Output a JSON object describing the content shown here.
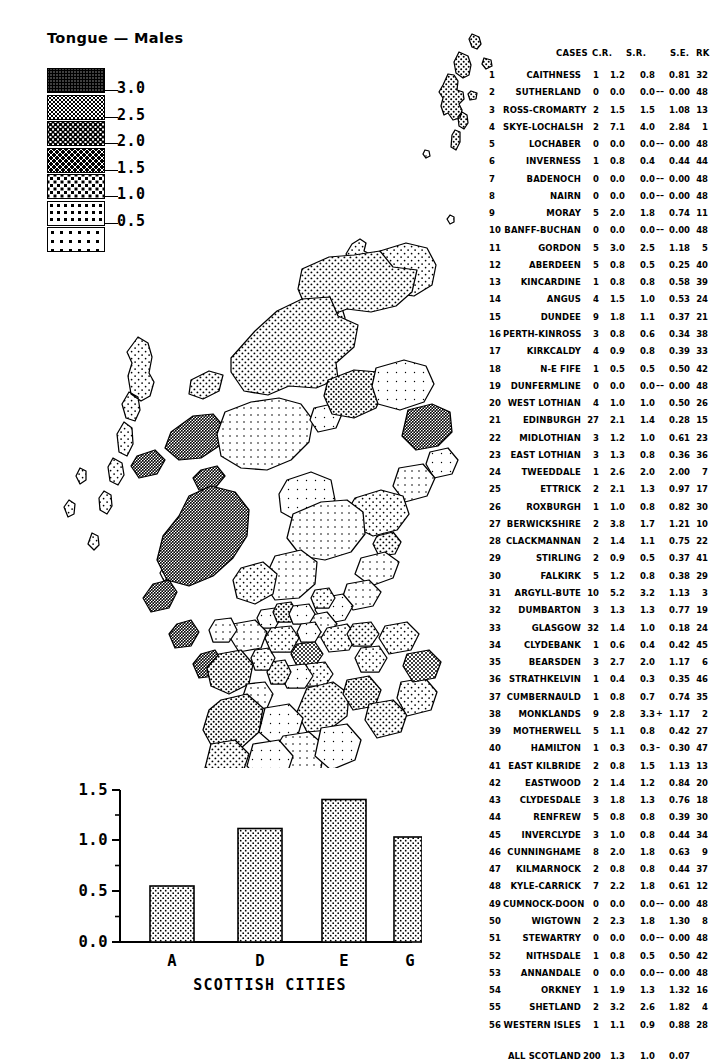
{
  "title": "Tongue — Males",
  "legend": {
    "name": "shading-legend",
    "labels": [
      "3.0",
      "2.5",
      "2.0",
      "1.5",
      "1.0",
      "0.5"
    ],
    "swatch_count": 7
  },
  "table": {
    "headers": {
      "cases": "CASES",
      "cr": "C.R.",
      "sr": "S.R.",
      "se": "S.E.",
      "rk": "RK"
    },
    "rows": [
      {
        "n": "1",
        "name": "CAITHNESS",
        "cases": "1",
        "cr": "1.2",
        "sr": "0.8",
        "sig": "",
        "se": "0.81",
        "rk": "32"
      },
      {
        "n": "2",
        "name": "SUTHERLAND",
        "cases": "0",
        "cr": "0.0",
        "sr": "0.0",
        "sig": "––",
        "se": "0.00",
        "rk": "48"
      },
      {
        "n": "3",
        "name": "ROSS-CROMARTY",
        "cases": "2",
        "cr": "1.5",
        "sr": "1.5",
        "sig": "",
        "se": "1.08",
        "rk": "13"
      },
      {
        "n": "4",
        "name": "SKYE-LOCHALSH",
        "cases": "2",
        "cr": "7.1",
        "sr": "4.0",
        "sig": "",
        "se": "2.84",
        "rk": "1"
      },
      {
        "n": "5",
        "name": "LOCHABER",
        "cases": "0",
        "cr": "0.0",
        "sr": "0.0",
        "sig": "––",
        "se": "0.00",
        "rk": "48"
      },
      {
        "n": "6",
        "name": "INVERNESS",
        "cases": "1",
        "cr": "0.8",
        "sr": "0.4",
        "sig": "",
        "se": "0.44",
        "rk": "44"
      },
      {
        "n": "7",
        "name": "BADENOCH",
        "cases": "0",
        "cr": "0.0",
        "sr": "0.0",
        "sig": "––",
        "se": "0.00",
        "rk": "48"
      },
      {
        "n": "8",
        "name": "NAIRN",
        "cases": "0",
        "cr": "0.0",
        "sr": "0.0",
        "sig": "––",
        "se": "0.00",
        "rk": "48"
      },
      {
        "n": "9",
        "name": "MORAY",
        "cases": "5",
        "cr": "2.0",
        "sr": "1.8",
        "sig": "",
        "se": "0.74",
        "rk": "11"
      },
      {
        "n": "10",
        "name": "BANFF-BUCHAN",
        "cases": "0",
        "cr": "0.0",
        "sr": "0.0",
        "sig": "––",
        "se": "0.00",
        "rk": "48"
      },
      {
        "n": "11",
        "name": "GORDON",
        "cases": "5",
        "cr": "3.0",
        "sr": "2.5",
        "sig": "",
        "se": "1.18",
        "rk": "5"
      },
      {
        "n": "12",
        "name": "ABERDEEN",
        "cases": "5",
        "cr": "0.8",
        "sr": "0.5",
        "sig": "",
        "se": "0.25",
        "rk": "40"
      },
      {
        "n": "13",
        "name": "KINCARDINE",
        "cases": "1",
        "cr": "0.8",
        "sr": "0.8",
        "sig": "",
        "se": "0.58",
        "rk": "39"
      },
      {
        "n": "14",
        "name": "ANGUS",
        "cases": "4",
        "cr": "1.5",
        "sr": "1.0",
        "sig": "",
        "se": "0.53",
        "rk": "24"
      },
      {
        "n": "15",
        "name": "DUNDEE",
        "cases": "9",
        "cr": "1.8",
        "sr": "1.1",
        "sig": "",
        "se": "0.37",
        "rk": "21"
      },
      {
        "n": "16",
        "name": "PERTH-KINROSS",
        "cases": "3",
        "cr": "0.8",
        "sr": "0.6",
        "sig": "",
        "se": "0.34",
        "rk": "38"
      },
      {
        "n": "17",
        "name": "KIRKCALDY",
        "cases": "4",
        "cr": "0.9",
        "sr": "0.8",
        "sig": "",
        "se": "0.39",
        "rk": "33"
      },
      {
        "n": "18",
        "name": "N-E FIFE",
        "cases": "1",
        "cr": "0.5",
        "sr": "0.5",
        "sig": "",
        "se": "0.50",
        "rk": "42"
      },
      {
        "n": "19",
        "name": "DUNFERMLINE",
        "cases": "0",
        "cr": "0.0",
        "sr": "0.0",
        "sig": "––",
        "se": "0.00",
        "rk": "48"
      },
      {
        "n": "20",
        "name": "WEST LOTHIAN",
        "cases": "4",
        "cr": "1.0",
        "sr": "1.0",
        "sig": "",
        "se": "0.50",
        "rk": "26"
      },
      {
        "n": "21",
        "name": "EDINBURGH",
        "cases": "27",
        "cr": "2.1",
        "sr": "1.4",
        "sig": "",
        "se": "0.28",
        "rk": "15"
      },
      {
        "n": "22",
        "name": "MIDLOTHIAN",
        "cases": "3",
        "cr": "1.2",
        "sr": "1.0",
        "sig": "",
        "se": "0.61",
        "rk": "23"
      },
      {
        "n": "23",
        "name": "EAST LOTHIAN",
        "cases": "3",
        "cr": "1.3",
        "sr": "0.8",
        "sig": "",
        "se": "0.36",
        "rk": "36"
      },
      {
        "n": "24",
        "name": "TWEEDDALE",
        "cases": "1",
        "cr": "2.6",
        "sr": "2.0",
        "sig": "",
        "se": "2.00",
        "rk": "7"
      },
      {
        "n": "25",
        "name": "ETTRICK",
        "cases": "2",
        "cr": "2.1",
        "sr": "1.3",
        "sig": "",
        "se": "0.97",
        "rk": "17"
      },
      {
        "n": "26",
        "name": "ROXBURGH",
        "cases": "1",
        "cr": "1.0",
        "sr": "0.8",
        "sig": "",
        "se": "0.82",
        "rk": "30"
      },
      {
        "n": "27",
        "name": "BERWICKSHIRE",
        "cases": "2",
        "cr": "3.8",
        "sr": "1.7",
        "sig": "",
        "se": "1.21",
        "rk": "10"
      },
      {
        "n": "28",
        "name": "CLACKMANNAN",
        "cases": "2",
        "cr": "1.4",
        "sr": "1.1",
        "sig": "",
        "se": "0.75",
        "rk": "22"
      },
      {
        "n": "29",
        "name": "STIRLING",
        "cases": "2",
        "cr": "0.9",
        "sr": "0.5",
        "sig": "",
        "se": "0.37",
        "rk": "41"
      },
      {
        "n": "30",
        "name": "FALKIRK",
        "cases": "5",
        "cr": "1.2",
        "sr": "0.8",
        "sig": "",
        "se": "0.38",
        "rk": "29"
      },
      {
        "n": "31",
        "name": "ARGYLL-BUTE",
        "cases": "10",
        "cr": "5.2",
        "sr": "3.2",
        "sig": "",
        "se": "1.13",
        "rk": "3"
      },
      {
        "n": "32",
        "name": "DUMBARTON",
        "cases": "3",
        "cr": "1.3",
        "sr": "1.3",
        "sig": "",
        "se": "0.77",
        "rk": "19"
      },
      {
        "n": "33",
        "name": "GLASGOW",
        "cases": "32",
        "cr": "1.4",
        "sr": "1.0",
        "sig": "",
        "se": "0.18",
        "rk": "24"
      },
      {
        "n": "34",
        "name": "CLYDEBANK",
        "cases": "1",
        "cr": "0.6",
        "sr": "0.4",
        "sig": "",
        "se": "0.42",
        "rk": "45"
      },
      {
        "n": "35",
        "name": "BEARSDEN",
        "cases": "3",
        "cr": "2.7",
        "sr": "2.0",
        "sig": "",
        "se": "1.17",
        "rk": "6"
      },
      {
        "n": "36",
        "name": "STRATHKELVIN",
        "cases": "1",
        "cr": "0.4",
        "sr": "0.3",
        "sig": "",
        "se": "0.35",
        "rk": "46"
      },
      {
        "n": "37",
        "name": "CUMBERNAULD",
        "cases": "1",
        "cr": "0.8",
        "sr": "0.7",
        "sig": "",
        "se": "0.74",
        "rk": "35"
      },
      {
        "n": "38",
        "name": "MONKLANDS",
        "cases": "9",
        "cr": "2.8",
        "sr": "3.3",
        "sig": "+",
        "se": "1.17",
        "rk": "2"
      },
      {
        "n": "39",
        "name": "MOTHERWELL",
        "cases": "5",
        "cr": "1.1",
        "sr": "0.8",
        "sig": "",
        "se": "0.42",
        "rk": "27"
      },
      {
        "n": "40",
        "name": "HAMILTON",
        "cases": "1",
        "cr": "0.3",
        "sr": "0.3",
        "sig": "–",
        "se": "0.30",
        "rk": "47"
      },
      {
        "n": "41",
        "name": "EAST KILBRIDE",
        "cases": "2",
        "cr": "0.8",
        "sr": "1.5",
        "sig": "",
        "se": "1.13",
        "rk": "13"
      },
      {
        "n": "42",
        "name": "EASTWOOD",
        "cases": "2",
        "cr": "1.4",
        "sr": "1.2",
        "sig": "",
        "se": "0.84",
        "rk": "20"
      },
      {
        "n": "43",
        "name": "CLYDESDALE",
        "cases": "3",
        "cr": "1.8",
        "sr": "1.3",
        "sig": "",
        "se": "0.76",
        "rk": "18"
      },
      {
        "n": "44",
        "name": "RENFREW",
        "cases": "5",
        "cr": "0.8",
        "sr": "0.8",
        "sig": "",
        "se": "0.39",
        "rk": "30"
      },
      {
        "n": "45",
        "name": "INVERCLYDE",
        "cases": "3",
        "cr": "1.0",
        "sr": "0.8",
        "sig": "",
        "se": "0.44",
        "rk": "34"
      },
      {
        "n": "46",
        "name": "CUNNINGHAME",
        "cases": "8",
        "cr": "2.0",
        "sr": "1.8",
        "sig": "",
        "se": "0.63",
        "rk": "9"
      },
      {
        "n": "47",
        "name": "KILMARNOCK",
        "cases": "2",
        "cr": "0.8",
        "sr": "0.8",
        "sig": "",
        "se": "0.44",
        "rk": "37"
      },
      {
        "n": "48",
        "name": "KYLE-CARRICK",
        "cases": "7",
        "cr": "2.2",
        "sr": "1.8",
        "sig": "",
        "se": "0.61",
        "rk": "12"
      },
      {
        "n": "49",
        "name": "CUMNOCK-DOON",
        "cases": "0",
        "cr": "0.0",
        "sr": "0.0",
        "sig": "––",
        "se": "0.00",
        "rk": "48"
      },
      {
        "n": "50",
        "name": "WIGTOWN",
        "cases": "2",
        "cr": "2.3",
        "sr": "1.8",
        "sig": "",
        "se": "1.30",
        "rk": "8"
      },
      {
        "n": "51",
        "name": "STEWARTRY",
        "cases": "0",
        "cr": "0.0",
        "sr": "0.0",
        "sig": "––",
        "se": "0.00",
        "rk": "48"
      },
      {
        "n": "52",
        "name": "NITHSDALE",
        "cases": "1",
        "cr": "0.8",
        "sr": "0.5",
        "sig": "",
        "se": "0.50",
        "rk": "42"
      },
      {
        "n": "53",
        "name": "ANNANDALE",
        "cases": "0",
        "cr": "0.0",
        "sr": "0.0",
        "sig": "––",
        "se": "0.00",
        "rk": "48"
      },
      {
        "n": "54",
        "name": "ORKNEY",
        "cases": "1",
        "cr": "1.9",
        "sr": "1.3",
        "sig": "",
        "se": "1.32",
        "rk": "16"
      },
      {
        "n": "55",
        "name": "SHETLAND",
        "cases": "2",
        "cr": "3.2",
        "sr": "2.6",
        "sig": "",
        "se": "1.82",
        "rk": "4"
      },
      {
        "n": "56",
        "name": "WESTERN ISLES",
        "cases": "1",
        "cr": "1.1",
        "sr": "0.9",
        "sig": "",
        "se": "0.88",
        "rk": "28"
      }
    ],
    "total": {
      "label": "ALL SCOTLAND",
      "cases": "200",
      "cr": "1.3",
      "sr": "1.0",
      "se": "0.07",
      "rk": ""
    }
  },
  "chart_data": {
    "type": "bar",
    "title": "",
    "categories": [
      "A",
      "D",
      "E",
      "G"
    ],
    "values": [
      0.55,
      1.12,
      1.4,
      1.03
    ],
    "xlabel": "SCOTTISH CITIES",
    "ylabel": "",
    "ylim": [
      0.0,
      1.5
    ],
    "ytick_labels": [
      "0.0",
      "0.5",
      "1.0",
      "1.5"
    ],
    "ytick_values": [
      0.0,
      0.5,
      1.0,
      1.5
    ],
    "minor_ticks": true,
    "grid": false,
    "legend": "none"
  }
}
